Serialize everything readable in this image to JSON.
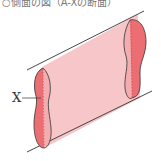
{
  "caption": "○側面の図（A-Xの断面）",
  "diagram": {
    "label": "X",
    "colors": {
      "tube_fill": "#f6c6c8",
      "end_cap_fill": "#ec6e72",
      "inner_fill": "#f3adb0",
      "outline": "#333333"
    }
  }
}
